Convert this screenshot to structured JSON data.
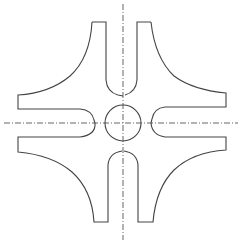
{
  "drawing": {
    "title": "",
    "description": "Cross-shaped plate with central circular hole and four arms, each with a slotted/rounded inner end",
    "colors": {
      "line": "#444444",
      "centerline": "#555555",
      "background": "#ffffff"
    },
    "center": [
      123,
      123
    ],
    "center_hole_radius": 18
  }
}
